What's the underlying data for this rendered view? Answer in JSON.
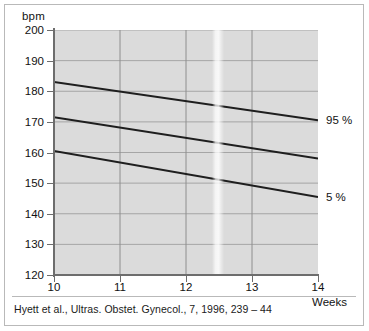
{
  "chart_data": {
    "type": "line",
    "title": "",
    "xlabel": "Weeks",
    "ylabel": "bpm",
    "xlim": [
      10,
      14
    ],
    "ylim": [
      120,
      200
    ],
    "grid": true,
    "legend_position": "right-outside",
    "x_ticks": [
      "10",
      "11",
      "12",
      "13",
      "14"
    ],
    "y_ticks": [
      "200",
      "190",
      "180",
      "170",
      "160",
      "150",
      "140",
      "130",
      "120"
    ],
    "x": [
      10,
      14
    ],
    "series": [
      {
        "name": "95 %",
        "values": [
          183.0,
          170.5
        ]
      },
      {
        "name": "median",
        "values": [
          171.5,
          158.0
        ]
      },
      {
        "name": "5 %",
        "values": [
          160.5,
          145.5
        ]
      }
    ],
    "annotations": [
      {
        "text": "95 %",
        "x": 14,
        "y": 170.5
      },
      {
        "text": "5 %",
        "x": 14,
        "y": 145.5
      }
    ]
  },
  "axes": {
    "unit_label": "bpm",
    "x_axis_title": "Weeks"
  },
  "caption": {
    "text": "Hyett et al., Ultras. Obstet. Gynecol., 7, 1996, 239 – 44"
  },
  "colors": {
    "plot_background": "#dbdbdb",
    "gridline": "#a5a5a5",
    "gridline_major": "#8e8e8e",
    "axis": "#6d6d6d",
    "series_line": "#1e1e1e",
    "frame": "#b9b9b9",
    "text": "#121212"
  }
}
